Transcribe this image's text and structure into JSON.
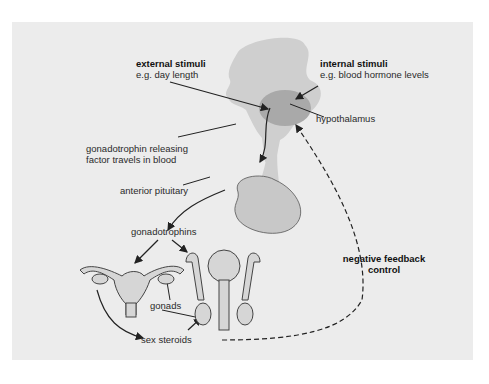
{
  "diagram": {
    "labels": {
      "external_title": "external stimuli",
      "external_sub": "e.g. day length",
      "internal_title": "internal stimuli",
      "internal_sub": "e.g. blood hormone levels",
      "hypothalamus": "hypothalamus",
      "gnrh_line1": "gonadotrophin releasing",
      "gnrh_line2": "factor travels in blood",
      "anterior_pituitary": "anterior pituitary",
      "gonadotrophins": "gonadotrophins",
      "gonads": "gonads",
      "sex_steroids": "sex steroids",
      "feedback_line1": "negative feedback",
      "feedback_line2": "control"
    },
    "colors": {
      "panel": "#ececec",
      "head": "#cfcfcf",
      "hypothalamus": "#a9a9a9",
      "pituitary": "#c8c8c8",
      "organ_fill": "#d6d6d6",
      "line": "#222222"
    }
  }
}
